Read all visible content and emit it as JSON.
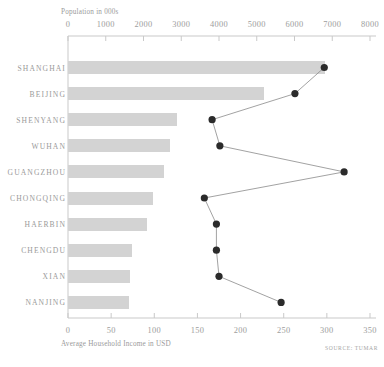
{
  "source_note": "SOURCE: TUMAR",
  "chart_data": {
    "type": "bar",
    "title": "",
    "subtitle": "",
    "orientation": "horizontal",
    "grid": false,
    "legend": "none",
    "categories": [
      "SHANGHAI",
      "BEIJING",
      "SHENYANG",
      "WUHAN",
      "GUANGZHOU",
      "CHONGQING",
      "HAERBIN",
      "CHENGDU",
      "XIAN",
      "NANJING"
    ],
    "top_axis": {
      "label": "Population in 000s",
      "position": "top",
      "ticks": [
        0,
        1000,
        2000,
        3000,
        4000,
        5000,
        6000,
        7000,
        8000
      ],
      "tick_labels": [
        "0",
        "1000",
        "2000",
        "3000",
        "4000",
        "5000",
        "6000",
        "7000",
        "8000"
      ],
      "range": [
        0,
        8000
      ]
    },
    "bottom_axis": {
      "label": "Average Household Income in USD",
      "position": "bottom",
      "ticks": [
        0,
        50,
        100,
        150,
        200,
        250,
        300,
        350
      ],
      "tick_labels": [
        "0",
        "50",
        "100",
        "150",
        "200",
        "250",
        "300",
        "350"
      ],
      "range": [
        0,
        350
      ]
    },
    "series": [
      {
        "name": "Population in 000s",
        "type": "bar",
        "axis": "top",
        "color": "#d3d3d3",
        "values": [
          6800,
          5200,
          2900,
          2700,
          2550,
          2250,
          2100,
          1700,
          1650,
          1620
        ]
      },
      {
        "name": "Average Household Income in USD",
        "type": "line",
        "axis": "bottom",
        "color": "#2b2b2b",
        "marker": "circle",
        "values": [
          297,
          263,
          167,
          176,
          320,
          158,
          172,
          172,
          175,
          247
        ]
      }
    ]
  }
}
